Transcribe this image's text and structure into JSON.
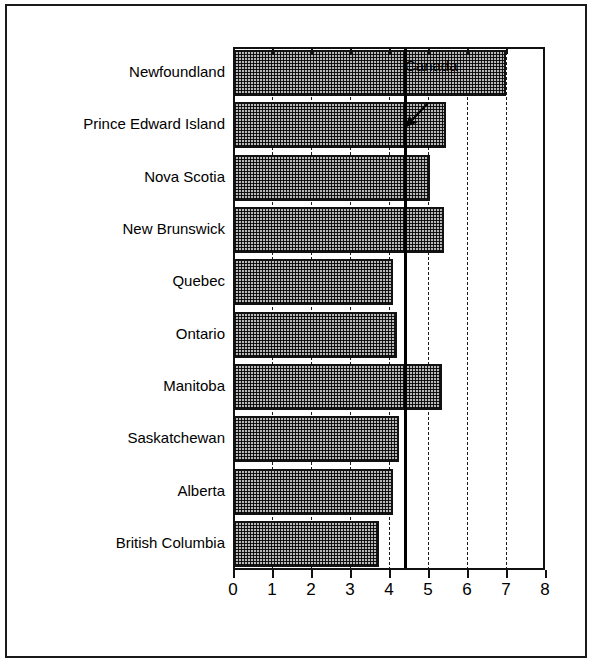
{
  "chart_data": {
    "type": "bar",
    "orientation": "horizontal",
    "title": "",
    "xlabel": "",
    "ylabel": "",
    "xlim": [
      0,
      8
    ],
    "xticks": [
      "0",
      "1",
      "2",
      "3",
      "4",
      "5",
      "6",
      "7",
      "8"
    ],
    "xtick_values": [
      0,
      1,
      2,
      3,
      4,
      5,
      6,
      7,
      8
    ],
    "grid": "vertical dashed gridlines at integer ticks",
    "legend": "none",
    "categories": [
      "Newfoundland",
      "Prince Edward Island",
      "Nova Scotia",
      "New Brunswick",
      "Quebec",
      "Ontario",
      "Manitoba",
      "Saskatchewan",
      "Alberta",
      "British Columbia"
    ],
    "values": [
      7.0,
      5.45,
      5.05,
      5.4,
      4.1,
      4.2,
      5.35,
      4.25,
      4.1,
      3.75
    ],
    "reference_line": {
      "label": "Canada",
      "value": 4.38,
      "style": "solid black vertical line"
    },
    "annotations": [
      {
        "text": "Canada",
        "points_to": "reference-line",
        "arrow": "down-left"
      }
    ],
    "colors": {
      "bar_fill": "#b8b8b8",
      "bar_pattern": "crosshatch",
      "bar_edge": "#111111",
      "axis": "#111111",
      "gridline": "#1a1a1a",
      "reference_line": "#000000",
      "background": "#ffffff",
      "frame_border": "#1a1a1a"
    }
  },
  "annotation": {
    "canada_label": "Canada"
  }
}
